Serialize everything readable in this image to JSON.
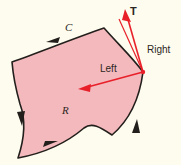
{
  "figure": {
    "kind": "vector-calculus-orientation-diagram",
    "background_color": "#fdfcef",
    "region_fill_color": "#f4b9bd",
    "curve_stroke_color": "#231f1c",
    "vector_color": "#e8202a",
    "labels": {
      "curve": "C",
      "region": "R",
      "tangent": "T",
      "right_side": "Right",
      "left_side": "Left"
    },
    "orientation": "counterclockwise",
    "arrow_count": 4
  }
}
